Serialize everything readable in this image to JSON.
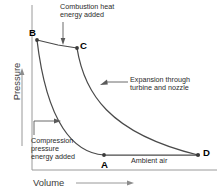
{
  "diagram": {
    "type": "pressure-volume-cycle",
    "title_visible": false,
    "axes": {
      "y": {
        "label": "Pressure",
        "arrow": "up-arrow-icon",
        "direction": "increasing-up"
      },
      "x": {
        "label": "Volume",
        "arrow": "right-arrow-icon",
        "direction": "increasing-right"
      },
      "frame": {
        "left_border": true,
        "bottom_border": true,
        "top_border": false,
        "right_border": false
      }
    },
    "points": [
      {
        "id": "A",
        "label": "A",
        "x_px": 104,
        "y_px": 155
      },
      {
        "id": "B",
        "label": "B",
        "x_px": 37,
        "y_px": 40
      },
      {
        "id": "C",
        "label": "C",
        "x_px": 77,
        "y_px": 48
      },
      {
        "id": "D",
        "label": "D",
        "x_px": 198,
        "y_px": 155
      }
    ],
    "processes": [
      {
        "from": "A",
        "to": "B",
        "shape": "curve-concave",
        "name": "compression"
      },
      {
        "from": "B",
        "to": "C",
        "shape": "near-straight",
        "name": "combustion-heat-addition"
      },
      {
        "from": "C",
        "to": "D",
        "shape": "curve-concave",
        "name": "expansion"
      },
      {
        "from": "A",
        "to": "D",
        "shape": "straight-horizontal",
        "name": "ambient-air"
      }
    ],
    "annotations": [
      {
        "id": "combustion",
        "text": "Combustion heat\nenergy added",
        "leader": "vertical-down-arrow",
        "targets": "B-C line"
      },
      {
        "id": "expansion",
        "text": "Expansion through\nturbine and nozzle",
        "leader": "horizontal-left-arrow",
        "targets": "C-D curve"
      },
      {
        "id": "compression",
        "text": "Compression\npressure\nenergy added",
        "leader": "elbow-right-arrow",
        "targets": "A-B curve"
      },
      {
        "id": "ambient",
        "text": "Ambient air",
        "leader": "none",
        "targets": "A-D line"
      }
    ],
    "colors": {
      "line": "#4a4a4a",
      "frame": "#8c8c8c",
      "text": "#2b2b2b",
      "point_marker": "#3a3a3a",
      "background": "#ffffff"
    }
  }
}
